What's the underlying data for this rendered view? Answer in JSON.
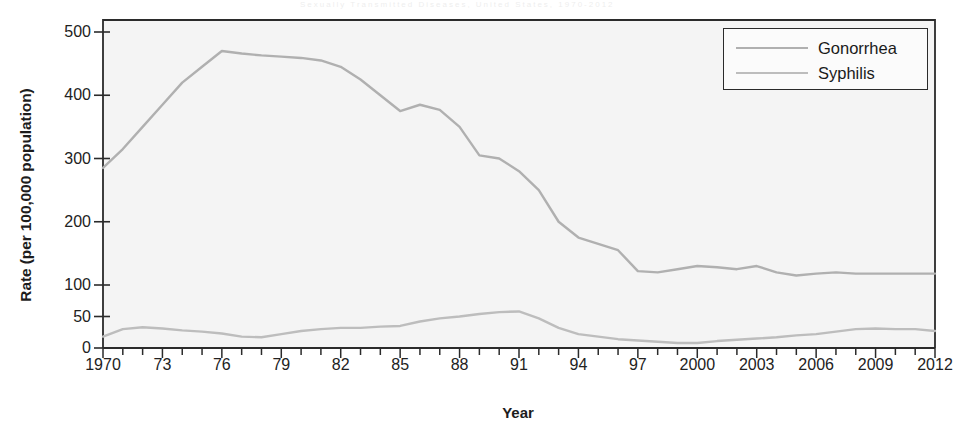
{
  "figure": {
    "scan_artifact_text": "Sexually Transmitted Diseases, United States, 1970-2012",
    "xlabel": "Year",
    "ylabel": "Rate (per 100,000 population)",
    "plot_bg": "#f4f4f4",
    "frame_color": "#2b2b2b",
    "line_color": "#b3b3b3"
  },
  "legend": {
    "position": "top-right",
    "entries": [
      {
        "label": "Gonorrhea",
        "color": "#b0b0b0"
      },
      {
        "label": "Syphilis",
        "color": "#bdbdbd"
      }
    ]
  },
  "chart_data": {
    "type": "line",
    "title": "",
    "xlabel": "Year",
    "ylabel": "Rate (per 100,000 population)",
    "xlim": [
      1970,
      2012
    ],
    "ylim": [
      0,
      500
    ],
    "grid": false,
    "legend_position": "top-right",
    "y_ticks": [
      0,
      50,
      100,
      200,
      300,
      400,
      500
    ],
    "y_axis_note": "Non-linear break: 0-50-100 spacing is compressed relative to 100-500",
    "x_ticks": [
      1970,
      1973,
      1976,
      1979,
      1982,
      1985,
      1988,
      1991,
      1994,
      1997,
      2000,
      2003,
      2006,
      2009,
      2012
    ],
    "x_tick_labels": [
      "1970",
      "73",
      "76",
      "79",
      "82",
      "85",
      "88",
      "91",
      "94",
      "97",
      "2000",
      "2003",
      "2006",
      "2009",
      "2012"
    ],
    "x_minor_tick_interval": 1,
    "x": [
      1970,
      1971,
      1972,
      1973,
      1974,
      1975,
      1976,
      1977,
      1978,
      1979,
      1980,
      1981,
      1982,
      1983,
      1984,
      1985,
      1986,
      1987,
      1988,
      1989,
      1990,
      1991,
      1992,
      1993,
      1994,
      1995,
      1996,
      1997,
      1998,
      1999,
      2000,
      2001,
      2002,
      2003,
      2004,
      2005,
      2006,
      2007,
      2008,
      2009,
      2010,
      2011,
      2012
    ],
    "series": [
      {
        "name": "Gonorrhea",
        "color": "#b0b0b0",
        "values": [
          285,
          315,
          350,
          385,
          420,
          445,
          470,
          466,
          463,
          461,
          459,
          455,
          445,
          425,
          400,
          375,
          385,
          377,
          350,
          305,
          300,
          280,
          250,
          200,
          175,
          165,
          155,
          122,
          120,
          125,
          130,
          128,
          125,
          130,
          120,
          115,
          118,
          120,
          118,
          118,
          118,
          118,
          118
        ]
      },
      {
        "name": "Syphilis",
        "color": "#bdbdbd",
        "values": [
          18,
          30,
          33,
          31,
          28,
          26,
          23,
          18,
          17,
          22,
          27,
          30,
          32,
          32,
          34,
          35,
          42,
          47,
          50,
          54,
          57,
          58,
          47,
          32,
          22,
          18,
          14,
          12,
          10,
          8,
          8,
          11,
          13,
          15,
          17,
          20,
          22,
          26,
          30,
          31,
          30,
          30,
          27
        ]
      }
    ]
  }
}
